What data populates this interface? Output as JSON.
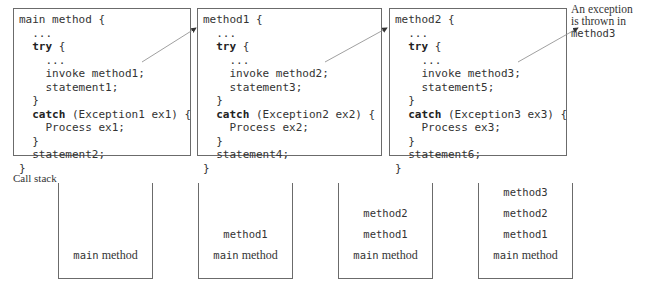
{
  "code_boxes": [
    {
      "lines": [
        {
          "indent": "",
          "kw": "",
          "text": "main method {"
        },
        {
          "indent": "  ",
          "kw": "",
          "text": "..."
        },
        {
          "indent": "  ",
          "kw": "try",
          "text": " {"
        },
        {
          "indent": "    ",
          "kw": "",
          "text": "..."
        },
        {
          "indent": "    ",
          "kw": "",
          "text": "invoke method1;"
        },
        {
          "indent": "    ",
          "kw": "",
          "text": "statement1;"
        },
        {
          "indent": "  ",
          "kw": "",
          "text": "}"
        },
        {
          "indent": "  ",
          "kw": "catch",
          "text": " (Exception1 ex1) {"
        },
        {
          "indent": "    ",
          "kw": "",
          "text": "Process ex1;"
        },
        {
          "indent": "  ",
          "kw": "",
          "text": "}"
        },
        {
          "indent": "  ",
          "kw": "",
          "text": "statement2;"
        },
        {
          "indent": "",
          "kw": "",
          "text": "}"
        }
      ]
    },
    {
      "lines": [
        {
          "indent": "",
          "kw": "",
          "text": "method1 {"
        },
        {
          "indent": "  ",
          "kw": "",
          "text": "..."
        },
        {
          "indent": "  ",
          "kw": "try",
          "text": " {"
        },
        {
          "indent": "    ",
          "kw": "",
          "text": "..."
        },
        {
          "indent": "    ",
          "kw": "",
          "text": "invoke method2;"
        },
        {
          "indent": "    ",
          "kw": "",
          "text": "statement3;"
        },
        {
          "indent": "  ",
          "kw": "",
          "text": "}"
        },
        {
          "indent": "  ",
          "kw": "catch",
          "text": " (Exception2 ex2) {"
        },
        {
          "indent": "    ",
          "kw": "",
          "text": "Process ex2;"
        },
        {
          "indent": "  ",
          "kw": "",
          "text": "}"
        },
        {
          "indent": "  ",
          "kw": "",
          "text": "statement4;"
        },
        {
          "indent": "",
          "kw": "",
          "text": "}"
        }
      ]
    },
    {
      "lines": [
        {
          "indent": "",
          "kw": "",
          "text": "method2 {"
        },
        {
          "indent": "  ",
          "kw": "",
          "text": "..."
        },
        {
          "indent": "  ",
          "kw": "try",
          "text": " {"
        },
        {
          "indent": "    ",
          "kw": "",
          "text": "..."
        },
        {
          "indent": "    ",
          "kw": "",
          "text": "invoke method3;"
        },
        {
          "indent": "    ",
          "kw": "",
          "text": "statement5;"
        },
        {
          "indent": "  ",
          "kw": "",
          "text": "}"
        },
        {
          "indent": "  ",
          "kw": "catch",
          "text": " (Exception3 ex3) {"
        },
        {
          "indent": "    ",
          "kw": "",
          "text": "Process ex3;"
        },
        {
          "indent": "  ",
          "kw": "",
          "text": "}"
        },
        {
          "indent": "  ",
          "kw": "",
          "text": "statement6;"
        },
        {
          "indent": "",
          "kw": "",
          "text": "}"
        }
      ]
    }
  ],
  "annotation": {
    "line1": "An exception",
    "line2": "is thrown in",
    "line3": "method3"
  },
  "call_stack": {
    "label": "Call stack",
    "stacks": [
      {
        "frames": [
          {
            "mono": "main",
            "serif": " method"
          }
        ]
      },
      {
        "frames": [
          {
            "mono": "method1",
            "serif": ""
          },
          {
            "mono": "main",
            "serif": " method"
          }
        ]
      },
      {
        "frames": [
          {
            "mono": "method2",
            "serif": ""
          },
          {
            "mono": "method1",
            "serif": ""
          },
          {
            "mono": "main",
            "serif": " method"
          }
        ]
      },
      {
        "frames": [
          {
            "mono": "method3",
            "serif": ""
          },
          {
            "mono": "method2",
            "serif": ""
          },
          {
            "mono": "method1",
            "serif": ""
          },
          {
            "mono": "main",
            "serif": " method"
          }
        ]
      }
    ]
  },
  "colors": {
    "border": "#6b6b6b",
    "text": "#333333",
    "arrow": "#888888"
  }
}
